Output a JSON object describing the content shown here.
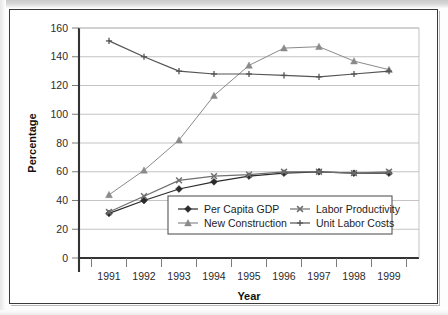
{
  "figure": {
    "background": "#ffffff",
    "frame_color": "#3a3a3a"
  },
  "chart_data": {
    "type": "line",
    "title": "",
    "xlabel": "Year",
    "ylabel": "Percentage",
    "categories": [
      "1991",
      "1992",
      "1993",
      "1994",
      "1995",
      "1996",
      "1997",
      "1998",
      "1999"
    ],
    "x": [
      1991,
      1992,
      1993,
      1994,
      1995,
      1996,
      1997,
      1998,
      1999
    ],
    "ylim": [
      0,
      160
    ],
    "yticks": [
      0,
      20,
      40,
      60,
      80,
      100,
      120,
      140,
      160
    ],
    "grid": "horizontal",
    "legend_position": "lower-center",
    "series": [
      {
        "name": "Per Capita GDP",
        "marker": "diamond",
        "color": "#2b2b2b",
        "values": [
          31,
          40,
          48,
          53,
          57,
          59,
          60,
          59,
          59
        ]
      },
      {
        "name": "New Construction",
        "marker": "triangle",
        "color": "#8a8a8a",
        "values": [
          44,
          61,
          82,
          113,
          134,
          146,
          147,
          137,
          131
        ]
      },
      {
        "name": "Labor Productivity",
        "marker": "x",
        "color": "#6f6f6f",
        "values": [
          32,
          43,
          54,
          57,
          58,
          60,
          60,
          59,
          60
        ]
      },
      {
        "name": "Unit Labor Costs",
        "marker": "plus",
        "color": "#545454",
        "values": [
          151,
          140,
          130,
          128,
          128,
          127,
          126,
          128,
          130
        ]
      }
    ]
  },
  "axes": {
    "y_title": "Percentage",
    "x_title": "Year",
    "y_tick_labels": [
      "0",
      "20",
      "40",
      "60",
      "80",
      "100",
      "120",
      "140",
      "160"
    ],
    "x_tick_labels": [
      "1991",
      "1992",
      "1993",
      "1994",
      "1995",
      "1996",
      "1997",
      "1998",
      "1999"
    ]
  },
  "legend": {
    "entries": [
      {
        "label": "Per Capita GDP",
        "marker": "diamond"
      },
      {
        "label": "Labor Productivity",
        "marker": "x"
      },
      {
        "label": "New Construction",
        "marker": "triangle"
      },
      {
        "label": "Unit Labor Costs",
        "marker": "plus"
      }
    ]
  }
}
